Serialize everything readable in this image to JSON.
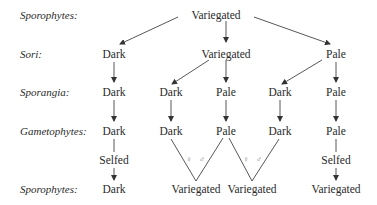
{
  "row_labels": [
    "Sporophytes:",
    "Sori:",
    "Sporangia:",
    "Gametophytes:",
    "Sporophytes:"
  ],
  "nodes": {
    "top": "Variegated",
    "sori": [
      "Dark",
      "Variegated",
      "Pale"
    ],
    "sporangia": [
      "Dark",
      "Dark",
      "Pale",
      "Dark",
      "Pale"
    ],
    "gametophytes": [
      "Dark",
      "Dark",
      "Pale",
      "Dark",
      "Pale"
    ],
    "selfed": [
      "Selfed",
      "Selfed"
    ],
    "offspring": [
      "Dark",
      "Variegated",
      "Variegated",
      "Variegated"
    ]
  },
  "cross_symbols": {
    "female": "♀",
    "male": "♂"
  }
}
